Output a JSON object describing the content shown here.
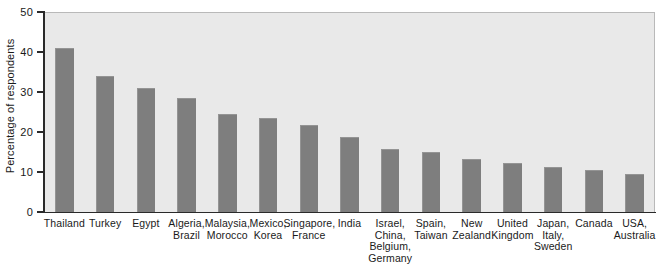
{
  "chart_data": {
    "type": "bar",
    "title": "",
    "xlabel": "",
    "ylabel": "Percentage of respondents",
    "ylim": [
      0,
      50
    ],
    "ytick_labels": [
      "50",
      "40",
      "30",
      "20",
      "10",
      "0"
    ],
    "ytick_values": [
      50,
      40,
      30,
      20,
      10,
      0
    ],
    "grid": false,
    "legend": "none",
    "bar_color": "#7e7e7e",
    "plot_background": "#e9e9e9",
    "categories": [
      "Thailand",
      "Turkey",
      "Egypt",
      "Algeria,\nBrazil",
      "Malaysia,\nMorocco",
      "Mexico,\nKorea",
      "Singapore,\nFrance",
      "India",
      "Israel,\nChina,\nBelgium,\nGermany",
      "Spain,\nTaiwan",
      "New\nZealand",
      "United\nKingdom",
      "Japan,\nItaly,\nSweden",
      "Canada",
      "USA,\nAustralia"
    ],
    "values": [
      41,
      34,
      31,
      28.5,
      24.5,
      23.5,
      21.8,
      18.8,
      15.8,
      15,
      13.2,
      12.3,
      11.3,
      10.5,
      9.5
    ]
  }
}
